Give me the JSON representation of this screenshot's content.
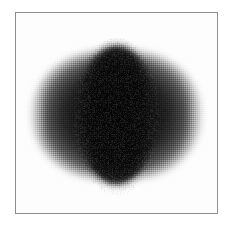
{
  "figure": {
    "background_color": "#ffffff",
    "frame": {
      "border_color": "#8d8d8d",
      "border_width_px": 1,
      "left_px": 15,
      "top_px": 12,
      "width_px": 203,
      "height_px": 202,
      "fill_color": "#fdfdfd"
    },
    "rendering": {
      "style": "halftone-dither",
      "colorspace": "grayscale",
      "texture": "ordered-dither-checker"
    }
  },
  "chart_data": {
    "type": "heatmap",
    "subtitle": "",
    "xlabel": "",
    "ylabel": "",
    "xlim": [
      0,
      200
    ],
    "ylim": [
      0,
      200
    ],
    "grid": false,
    "legend": false,
    "colormap": "grayscale",
    "value_range": [
      0,
      255
    ],
    "annotations": [],
    "features": [
      {
        "name": "outer-halo",
        "shape": "rounded-square-ellipse",
        "center": [
          100,
          106
        ],
        "width": 170,
        "height": 134,
        "peak_value": 20,
        "edge_value": 253
      },
      {
        "name": "core-lens",
        "shape": "vertical-ellipse",
        "center": [
          100,
          103
        ],
        "width": 68,
        "height": 126,
        "peak_value": 8,
        "edge_value": 60
      },
      {
        "name": "core-nucleus",
        "shape": "vertical-ellipse",
        "center": [
          100,
          104
        ],
        "width": 58,
        "height": 106,
        "peak_value": 4,
        "edge_value": 22
      }
    ],
    "profile_horizontal": {
      "x": [
        0,
        12,
        24,
        36,
        48,
        60,
        72,
        84,
        96,
        100,
        108,
        120,
        132,
        144,
        156,
        168,
        180,
        192,
        200
      ],
      "values": [
        253,
        252,
        248,
        224,
        176,
        120,
        72,
        38,
        14,
        10,
        14,
        38,
        72,
        120,
        176,
        224,
        248,
        252,
        253
      ]
    },
    "profile_vertical": {
      "y": [
        0,
        12,
        24,
        36,
        48,
        60,
        72,
        84,
        96,
        104,
        116,
        128,
        140,
        152,
        164,
        176,
        188,
        200
      ],
      "values": [
        253,
        252,
        250,
        244,
        206,
        120,
        52,
        22,
        10,
        8,
        10,
        20,
        44,
        86,
        150,
        216,
        248,
        253
      ]
    }
  }
}
